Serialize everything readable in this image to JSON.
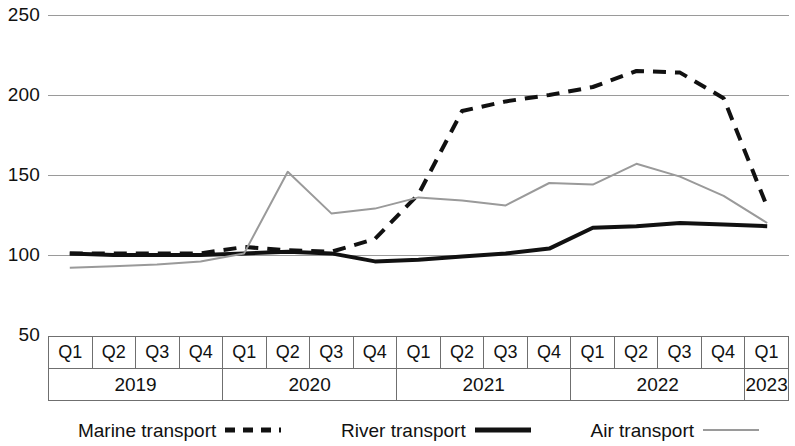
{
  "chart_data": {
    "type": "line",
    "title": "",
    "subtitle": "",
    "xlabel": "",
    "ylabel": "",
    "ylim": [
      50,
      250
    ],
    "yticks": [
      250,
      200,
      150,
      100,
      50
    ],
    "grid": true,
    "legend_position": "bottom",
    "x": [
      "2019 Q1",
      "2019 Q2",
      "2019 Q3",
      "2019 Q4",
      "2020 Q1",
      "2020 Q2",
      "2020 Q3",
      "2020 Q4",
      "2021 Q1",
      "2021 Q2",
      "2021 Q3",
      "2021 Q4",
      "2022 Q1",
      "2022 Q2",
      "2022 Q3",
      "2022 Q4",
      "2023 Q1"
    ],
    "quarters": [
      "Q1",
      "Q2",
      "Q3",
      "Q4",
      "Q1",
      "Q2",
      "Q3",
      "Q4",
      "Q1",
      "Q2",
      "Q3",
      "Q4",
      "Q1",
      "Q2",
      "Q3",
      "Q4",
      "Q1"
    ],
    "year_groups": [
      {
        "year": "2019",
        "span": 4
      },
      {
        "year": "2020",
        "span": 4
      },
      {
        "year": "2021",
        "span": 4
      },
      {
        "year": "2022",
        "span": 4
      },
      {
        "year": "2023",
        "span": 1
      }
    ],
    "series": [
      {
        "name": "Marine transport",
        "style": "dashed",
        "color": "#111111",
        "width": 4,
        "values": [
          101,
          101,
          101,
          101,
          105,
          103,
          102,
          110,
          138,
          190,
          196,
          200,
          205,
          215,
          214,
          198,
          130
        ]
      },
      {
        "name": "River transport",
        "style": "solid",
        "color": "#111111",
        "width": 4,
        "values": [
          101,
          100,
          100,
          100,
          101,
          102,
          101,
          96,
          97,
          99,
          101,
          104,
          117,
          118,
          120,
          119,
          118
        ]
      },
      {
        "name": "Air transport",
        "style": "thin",
        "color": "#9a9a9a",
        "width": 2,
        "values": [
          92,
          93,
          94,
          96,
          101,
          152,
          126,
          129,
          136,
          134,
          131,
          145,
          144,
          157,
          149,
          137,
          120
        ]
      }
    ]
  },
  "legend": {
    "items": [
      {
        "label": "Marine transport",
        "swatch": "dashed-line-swatch"
      },
      {
        "label": "River transport",
        "swatch": "solid-thick-line-swatch"
      },
      {
        "label": "Air transport",
        "swatch": "thin-gray-line-swatch"
      }
    ]
  }
}
